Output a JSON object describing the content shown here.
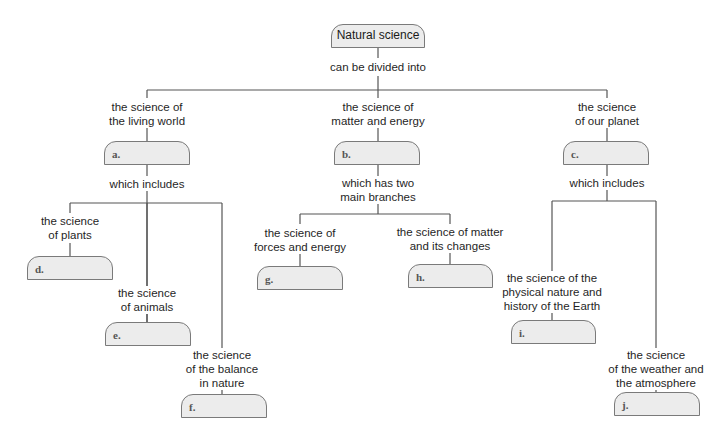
{
  "diagram": {
    "type": "concept-map",
    "root": {
      "label": "Natural science"
    },
    "root_link": "can be divided into",
    "branches": [
      {
        "label": "the science of the living world",
        "label_lines": [
          "the science of",
          "the living world"
        ],
        "box": "a.",
        "link": "which includes",
        "children": [
          {
            "label_lines": [
              "the science",
              "of plants"
            ],
            "box": "d."
          },
          {
            "label_lines": [
              "the science",
              "of animals"
            ],
            "box": "e."
          },
          {
            "label_lines": [
              "the science",
              "of the balance",
              "in nature"
            ],
            "box": "f."
          }
        ]
      },
      {
        "label": "the science of matter and energy",
        "label_lines": [
          "the science of",
          "matter and energy"
        ],
        "box": "b.",
        "link_lines": [
          "which has two",
          "main branches"
        ],
        "children": [
          {
            "label_lines": [
              "the science of",
              "forces and energy"
            ],
            "box": "g."
          },
          {
            "label_lines": [
              "the science of matter",
              "and its changes"
            ],
            "box": "h."
          }
        ]
      },
      {
        "label": "the science of our planet",
        "label_lines": [
          "the science",
          "of our planet"
        ],
        "box": "c.",
        "link": "which includes",
        "children": [
          {
            "label_lines": [
              "the science of the",
              "physical nature and",
              "history of the Earth"
            ],
            "box": "i."
          },
          {
            "label_lines": [
              "the science",
              "of the weather and",
              "the atmosphere"
            ],
            "box": "j."
          }
        ]
      }
    ]
  },
  "colors": {
    "box_fill": "#ececec",
    "box_border": "#7a7a7a",
    "line": "#555555",
    "text": "#1f1f1f"
  }
}
